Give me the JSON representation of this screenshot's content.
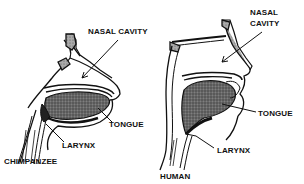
{
  "diagram": {
    "panels": [
      {
        "name": "CHIMPANZEE",
        "labels": {
          "nasal_cavity": "NASAL CAVITY",
          "tongue": "TONGUE",
          "larynx": "LARYNX"
        }
      },
      {
        "name": "HUMAN",
        "labels": {
          "nasal_cavity_line1": "NASAL",
          "nasal_cavity_line2": "CAVITY",
          "tongue": "TONGUE",
          "larynx": "LARYNX"
        }
      }
    ],
    "colors": {
      "ink": "#111111",
      "tongue_fill": "#555555",
      "bone_fill": "#9a9a9a",
      "background": "#ffffff"
    }
  }
}
